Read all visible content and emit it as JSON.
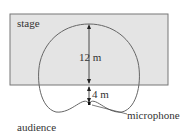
{
  "diagram": {
    "stage_label": "stage",
    "audience_label": "audience",
    "microphone_label": "microphone",
    "dim_top": "12 m",
    "dim_bottom": "4 m",
    "colors": {
      "stage_fill": "#e4e4e4",
      "stage_border": "#777777",
      "curve": "#666666",
      "text": "#333333"
    }
  }
}
